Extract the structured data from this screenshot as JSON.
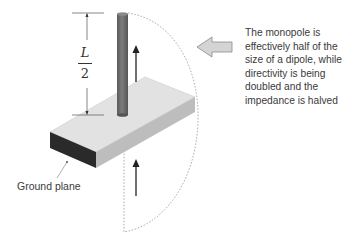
{
  "diagram": {
    "dimension_label": {
      "numerator": "L",
      "denominator": "2"
    },
    "ground_plane_label": "Ground plane",
    "caption_lines": [
      "The monopole is",
      "effectively half of the",
      "size of a dipole, while",
      "directivity is being",
      "doubled and the",
      "impedance is halved"
    ],
    "elements": {
      "monopole": "vertical-rod",
      "current_arrows": [
        "up-arrow-upper",
        "up-arrow-lower"
      ],
      "pointer_arrow": "left-block-arrow",
      "image_boundary": "dashed-half-ellipse"
    },
    "colors": {
      "rod": "#6f6f6f",
      "ground_top": "#e2e2e2",
      "ground_side": "#bdbdbd",
      "ground_front": "#2a2a2a",
      "block_arrow_fill": "#d4d4d4",
      "block_arrow_stroke": "#8a8a8a",
      "text": "#3a3a3a"
    }
  }
}
